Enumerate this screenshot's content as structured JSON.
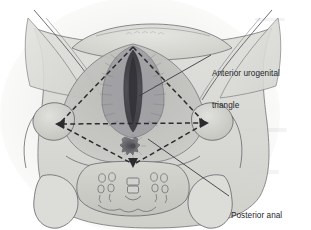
{
  "figure": {
    "type": "anatomical-illustration",
    "width": 311,
    "height": 230,
    "background_color": "#ffffff"
  },
  "labels": [
    {
      "id": "anterior",
      "name": "anterior-urogenital-triangle-label",
      "line1": "Anterior urogenital",
      "line2": "triangle",
      "text_color": "#25252a",
      "leader_from": [
        211,
        55
      ],
      "leader_to": [
        139,
        96
      ]
    },
    {
      "id": "posterior",
      "name": "posterior-anal-triangle-label",
      "line1": "Posterior anal",
      "line2": "triangle",
      "text_color": "#25252a",
      "leader_from": [
        229,
        196
      ],
      "leader_to": [
        148,
        139
      ]
    }
  ],
  "diagram": {
    "dashed_color": "#2b2b30",
    "dash_pattern": "5,3.2",
    "dash_width": 1.5,
    "outline_color": "#5a5a60",
    "vertices": {
      "pubic_apex": [
        133,
        47
      ],
      "left_ischial_tuberosity": [
        57,
        124
      ],
      "right_ischial_tuberosity": [
        207,
        123
      ],
      "coccyx_apex": [
        133,
        166
      ]
    },
    "triangles": [
      {
        "name": "urogenital-triangle",
        "region": "anterior",
        "points": "133,47 57,124 207,123"
      },
      {
        "name": "anal-triangle",
        "region": "posterior",
        "points": "57,124 207,123 133,166"
      }
    ],
    "arrowheads": [
      {
        "name": "left-tuberosity-arrowhead",
        "at": [
          57,
          124
        ],
        "direction": "left"
      },
      {
        "name": "right-tuberosity-arrowhead",
        "at": [
          207,
          123
        ],
        "direction": "right"
      },
      {
        "name": "coccyx-arrowhead",
        "at": [
          133,
          166
        ],
        "direction": "down"
      }
    ],
    "structures": [
      {
        "name": "vulva-vaginal-opening",
        "tone": "#4a4a50"
      },
      {
        "name": "labia",
        "tone": "#8e8e94"
      },
      {
        "name": "mons-pubis",
        "tone": "#d8d8d4"
      },
      {
        "name": "anus",
        "tone": "#5c5c62"
      },
      {
        "name": "ischial-tuberosity-left",
        "tone": "#c9c9c6"
      },
      {
        "name": "ischial-tuberosity-right",
        "tone": "#c9c9c6"
      },
      {
        "name": "sacrum",
        "tone": "#cfcfcb"
      },
      {
        "name": "coccyx",
        "tone": "#c6c6c2"
      },
      {
        "name": "sacral-foramina",
        "tone": "#b4b4b0"
      },
      {
        "name": "gluteal-region-left",
        "tone": "#d2d2ce"
      },
      {
        "name": "gluteal-region-right",
        "tone": "#d2d2ce"
      },
      {
        "name": "thigh-left",
        "tone": "#dcdcd8"
      },
      {
        "name": "thigh-right",
        "tone": "#dcdcd8"
      }
    ]
  }
}
